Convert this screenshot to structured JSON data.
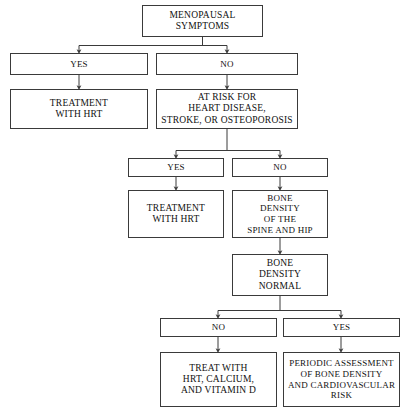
{
  "diagram": {
    "background_color": "#ffffff",
    "line_color": "#3a3a3a",
    "text_color": "#111111",
    "nodes": {
      "menopausal_symptoms": "MENOPAUSAL\nSYMPTOMS",
      "yes_1": "YES",
      "no_1": "NO",
      "treatment_hrt_1": "TREATMENT\nWITH HRT",
      "at_risk": "AT RISK FOR\nHEART DISEASE,\nSTROKE, OR OSTEOPOROSIS",
      "yes_2": "YES",
      "no_2": "NO",
      "treatment_hrt_2": "TREATMENT\nWITH HRT",
      "bone_density_spine_hip": "BONE\nDENSITY\nOF THE\nSPINE AND HIP",
      "bone_density_normal": "BONE\nDENSITY\nNORMAL",
      "no_3": "NO",
      "yes_3": "YES",
      "treat_with": "TREAT WITH\nHRT, CALCIUM,\nAND VITAMIN D",
      "periodic_assessment": "PERIODIC ASSESSMENT\nOF BONE DENSITY\nAND CARDIOVASCULAR\nRISK"
    }
  }
}
